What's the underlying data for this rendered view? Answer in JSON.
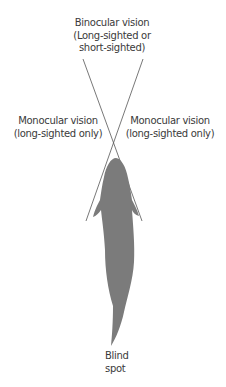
{
  "labels": {
    "binocular": {
      "line1": "Binocular vision",
      "line2": "(Long-sighted or",
      "line3": "short-sighted)"
    },
    "monocular_left": {
      "line1": "Monocular vision",
      "line2": "(long-sighted only)"
    },
    "monocular_right": {
      "line1": "Monocular vision",
      "line2": "(long-sighted only)"
    },
    "blind_spot": {
      "line1": "Blind",
      "line2": "spot"
    }
  },
  "colors": {
    "fish": "#7b7b7b",
    "lines": "#555555",
    "text": "#3a3a3a"
  }
}
